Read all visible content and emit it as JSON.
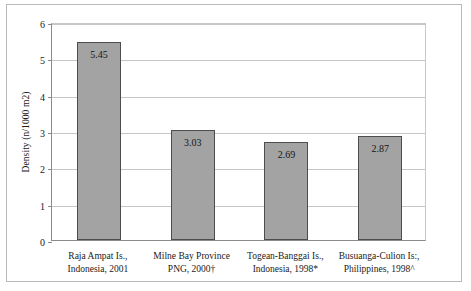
{
  "chart_data": {
    "type": "bar",
    "title": "",
    "xlabel": "",
    "ylabel": "Density (n/1000 m2)",
    "ylim": [
      0,
      6
    ],
    "yticks": [
      0,
      1,
      2,
      3,
      4,
      5,
      6
    ],
    "ytick_labels": [
      "0",
      "1",
      "2",
      "3",
      "4",
      "5",
      "6"
    ],
    "grid": true,
    "legend": "none",
    "bar_color": "#a3a3a3",
    "bar_edge_color": "#4d4d4d",
    "gridline_color": "#c6c6c6",
    "axis_color": "#8a8a8a",
    "categories": [
      "Raja Ampat Is., Indonesia, 2001",
      "Milne Bay Province PNG, 2000†",
      "Togean-Banggai Is., Indonesia, 1998*",
      "Busuanga-Culion Is:, Philippines, 1998^"
    ],
    "category_lines": [
      [
        "Raja Ampat Is.,",
        "Indonesia, 2001"
      ],
      [
        "Milne Bay Province",
        "PNG, 2000†"
      ],
      [
        "Togean-Banggai Is.,",
        "Indonesia, 1998*"
      ],
      [
        "Busuanga-Culion Is:,",
        "Philippines, 1998^"
      ]
    ],
    "values": [
      5.45,
      3.03,
      2.69,
      2.87
    ],
    "value_labels": [
      "5.45",
      "3.03",
      "2.69",
      "2.87"
    ]
  }
}
